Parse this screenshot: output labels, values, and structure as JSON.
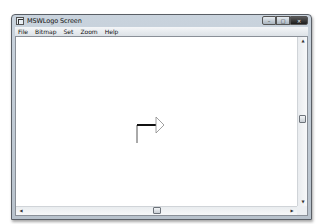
{
  "window": {
    "title": "MSWLogo Screen",
    "controls": {
      "minimize": "–",
      "maximize": "□",
      "close": "✕"
    }
  },
  "menubar": {
    "items": [
      {
        "label": "File"
      },
      {
        "label": "Bitmap"
      },
      {
        "label": "Set"
      },
      {
        "label": "Zoom"
      },
      {
        "label": "Help"
      }
    ]
  },
  "canvas": {
    "turtle": {
      "shape": "outlined triangle arrow pointing right",
      "heading": "east",
      "color": "#888888"
    },
    "drawn_lines": [
      {
        "from": [
          146,
          141
        ],
        "to": [
          146,
          123
        ],
        "color": "#555555",
        "width": 1
      },
      {
        "from": [
          146,
          123
        ],
        "to": [
          165,
          123
        ],
        "color": "#111111",
        "width": 2
      }
    ]
  },
  "scrollbars": {
    "vertical": {
      "up_arrow": "▲",
      "down_arrow": "▼",
      "thumb_position_pct": 50
    },
    "horizontal": {
      "left_arrow": "◀",
      "right_arrow": "▶",
      "thumb_position_pct": 50
    }
  }
}
